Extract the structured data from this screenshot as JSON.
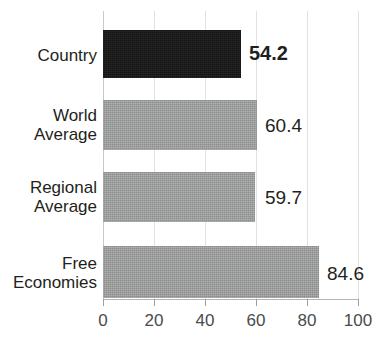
{
  "chart_data": {
    "type": "bar",
    "orientation": "horizontal",
    "title": "",
    "title_visible": false,
    "xlabel": "",
    "ylabel": "",
    "xlim": [
      0,
      100
    ],
    "xticks": [
      0,
      20,
      40,
      60,
      80,
      100
    ],
    "xtick_labels": [
      "0",
      "20",
      "40",
      "60",
      "80",
      "100"
    ],
    "grid": true,
    "legend": "none",
    "categories": [
      "Country",
      "World Average",
      "Regional Average",
      "Free Economies"
    ],
    "values": [
      54.2,
      59.7,
      60.4,
      84.6
    ],
    "bars": [
      {
        "category": "Country",
        "label_lines": [
          "Country"
        ],
        "value": 54.2,
        "value_label": "54.2",
        "color": "#151515",
        "highlight": true
      },
      {
        "category": "World Average",
        "label_lines": [
          "World",
          "Average"
        ],
        "value": 60.4,
        "value_label": "60.4",
        "color": "#9a9b9b",
        "highlight": false
      },
      {
        "category": "Regional Average",
        "label_lines": [
          "Regional",
          "Average"
        ],
        "value": 59.7,
        "value_label": "59.7",
        "color": "#9a9b9b",
        "highlight": false
      },
      {
        "category": "Free Economies",
        "label_lines": [
          "Free",
          "Economies"
        ],
        "value": 84.6,
        "value_label": "84.6",
        "color": "#9a9b9b",
        "highlight": false
      }
    ]
  },
  "colors": {
    "highlight_bar": "#151515",
    "default_bar": "#9a9b9b",
    "gridline": "#e2e2e2",
    "axis": "#b4b4b4",
    "text": "#231f20",
    "tick_text": "#4b4b4b",
    "background": "#ffffff"
  }
}
